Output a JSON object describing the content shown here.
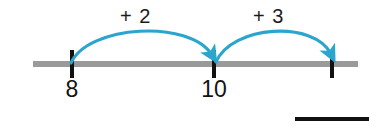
{
  "diagram": {
    "colors": {
      "arc": "#2BA5CD",
      "line": "#9a9a9a",
      "tick": "#111111",
      "text": "#131313",
      "rule": "#111111",
      "background": "#ffffff"
    },
    "number_line": {
      "start_x": 33,
      "end_x": 358,
      "y": 64,
      "thickness": 6
    },
    "ticks": [
      {
        "name": "tick-8",
        "x": 72,
        "label": "8"
      },
      {
        "name": "tick-10",
        "x": 214,
        "label": "10"
      },
      {
        "name": "tick-13",
        "x": 332,
        "label": ""
      }
    ],
    "jumps": [
      {
        "name": "jump-plus-2",
        "label": "+ 2",
        "from_x": 72,
        "to_x": 214,
        "apex_y": 30
      },
      {
        "name": "jump-plus-3",
        "label": "+ 3",
        "from_x": 214,
        "to_x": 332,
        "apex_y": 30
      }
    ],
    "answer_rule": {
      "name": "answer-blank-rule",
      "x": 295,
      "y": 117,
      "width": 74
    }
  }
}
